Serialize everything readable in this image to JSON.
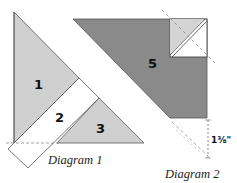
{
  "diagram1": {
    "caption": "Diagram 1",
    "pieces": [
      {
        "id": "1",
        "label": "1",
        "fill": "#d0d0d0"
      },
      {
        "id": "2",
        "label": "2",
        "fill": "#ffffff"
      },
      {
        "id": "3",
        "label": "3",
        "fill": "#d0d0d0"
      }
    ]
  },
  "diagram2": {
    "caption": "Diagram 2",
    "pieces": [
      {
        "id": "5",
        "label": "5",
        "fill": "#8a8a8a"
      }
    ],
    "corner_square": {
      "light_fill": "#d4d4d4",
      "white_fill": "#ffffff"
    },
    "measurement": "1⅜\""
  },
  "colors": {
    "light_gray": "#d0d0d0",
    "dark_gray": "#8a8a8a",
    "outline": "#555555",
    "dashed": "#888888"
  }
}
